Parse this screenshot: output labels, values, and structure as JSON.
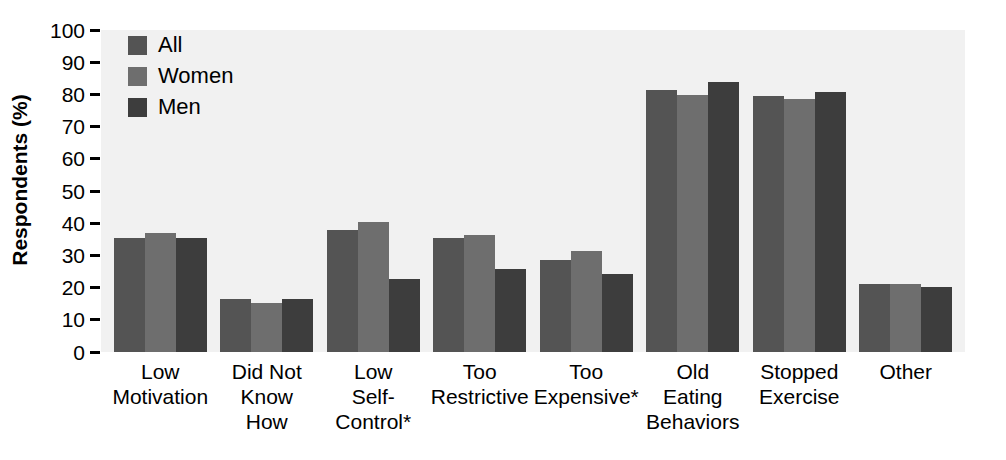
{
  "chart_data": {
    "type": "bar",
    "title": "",
    "xlabel": "",
    "ylabel": "Respondents (%)",
    "ylim": [
      0,
      100
    ],
    "ytick_labels": [
      "100",
      "90",
      "80",
      "70",
      "60",
      "50",
      "40",
      "30",
      "20",
      "10",
      "0"
    ],
    "ytick_values": [
      100,
      90,
      80,
      70,
      60,
      50,
      40,
      30,
      20,
      10,
      0
    ],
    "grid": false,
    "legend_position": "top-left",
    "categories": [
      "Low\nMotivation",
      "Did Not\nKnow\nHow",
      "Low\nSelf-\nControl*",
      "Too\nRestrictive",
      "Too\nExpensive*",
      "Old\nEating\nBehaviors",
      "Stopped\nExercise",
      "Other"
    ],
    "series": [
      {
        "name": "All",
        "color": "#545454",
        "values": [
          35.5,
          16.4,
          38.0,
          35.3,
          28.6,
          81.3,
          79.6,
          21.0
        ]
      },
      {
        "name": "Women",
        "color": "#6e6e6e",
        "values": [
          37.0,
          15.1,
          40.3,
          36.2,
          31.3,
          79.8,
          78.6,
          21.0
        ]
      },
      {
        "name": "Men",
        "color": "#3d3d3d",
        "values": [
          35.4,
          16.4,
          22.6,
          25.8,
          24.3,
          84.0,
          80.8,
          20.3
        ]
      }
    ]
  }
}
